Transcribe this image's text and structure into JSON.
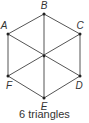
{
  "diagram": {
    "caption": "6 triangles",
    "stroke_color": "#555555",
    "point_color": "#222222",
    "label_color": "#333333",
    "vertices": [
      {
        "id": "A",
        "x": 8,
        "y": 34,
        "label_x": 4,
        "label_y": 29
      },
      {
        "id": "B",
        "x": 44,
        "y": 14,
        "label_x": 44,
        "label_y": 9
      },
      {
        "id": "C",
        "x": 80,
        "y": 34,
        "label_x": 80,
        "label_y": 29
      },
      {
        "id": "D",
        "x": 80,
        "y": 76,
        "label_x": 79,
        "label_y": 89
      },
      {
        "id": "E",
        "x": 44,
        "y": 98,
        "label_x": 44,
        "label_y": 110
      },
      {
        "id": "F",
        "x": 8,
        "y": 76,
        "label_x": 9,
        "label_y": 89
      }
    ],
    "edges": [
      [
        "A",
        "B"
      ],
      [
        "B",
        "C"
      ],
      [
        "C",
        "D"
      ],
      [
        "D",
        "E"
      ],
      [
        "E",
        "F"
      ],
      [
        "F",
        "A"
      ],
      [
        "B",
        "E"
      ],
      [
        "A",
        "D"
      ],
      [
        "C",
        "F"
      ]
    ]
  }
}
